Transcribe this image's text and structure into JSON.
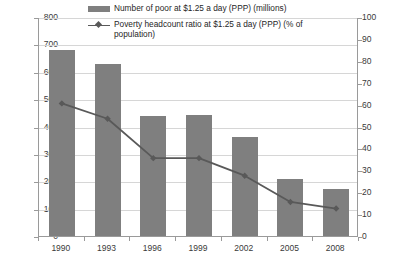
{
  "chart_data": {
    "type": "bar",
    "title": "",
    "xlabel": "",
    "ylabel": "",
    "categories": [
      "1990",
      "1993",
      "1996",
      "1999",
      "2002",
      "2005",
      "2008"
    ],
    "series": [
      {
        "name": "Number of poor at $1.25 a day (PPP) (millions)",
        "type": "bar",
        "axis": "left",
        "color": "#7f7f7f",
        "values": [
          680,
          630,
          440,
          443,
          360,
          208,
          170
        ]
      },
      {
        "name": "Poverty headcount ratio at $1.25 a day (PPP) (% of population)",
        "type": "line",
        "axis": "right",
        "color": "#595959",
        "marker": "diamond",
        "values": [
          61,
          54,
          36,
          36,
          28,
          16,
          13
        ]
      }
    ],
    "left_axis": {
      "ticks": [
        "0",
        "100",
        "200",
        "300",
        "400",
        "500",
        "600",
        "700",
        "800"
      ],
      "ylim": [
        0,
        800
      ],
      "step": 100
    },
    "right_axis": {
      "ticks": [
        "0",
        "10",
        "20",
        "30",
        "40",
        "50",
        "60",
        "70",
        "80",
        "90",
        "100"
      ],
      "ylim": [
        0,
        100
      ],
      "step": 10
    },
    "grid": true,
    "legend_position": "top-inside",
    "legend": [
      "Number of poor at $1.25 a day (PPP) (millions)",
      "Poverty headcount ratio at $1.25 a day (PPP) (% of population)"
    ]
  },
  "colors": {
    "bar": "#7f7f7f",
    "line": "#595959",
    "grid": "#d6d6d6",
    "axis": "#9a9a9a",
    "text": "#3a3a3a",
    "background": "#ffffff"
  }
}
